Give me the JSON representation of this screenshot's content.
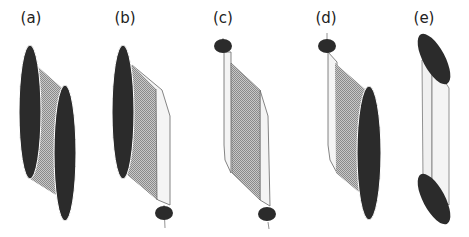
{
  "figure": {
    "panels": [
      {
        "id": "a",
        "label": "(a)",
        "description": "large ellipse left-top, large ellipse right-bottom, hatched band between"
      },
      {
        "id": "b",
        "label": "(b)",
        "description": "large ellipse left-top, small ellipse bottom-right, hatched band and thin light strip"
      },
      {
        "id": "c",
        "label": "(c)",
        "description": "small ellipse top-left, small ellipse bottom-right, hatched parallelogram with light side strips"
      },
      {
        "id": "d",
        "label": "(d)",
        "description": "small ellipse top-left, large ellipse bottom-right, hatched band and light strip"
      },
      {
        "id": "e",
        "label": "(e)",
        "description": "tilted ellipse top, tilted ellipse bottom, light strips connecting"
      }
    ],
    "colors": {
      "ellipse_fill": "#2b2b2b",
      "hatch_fill": "#a8a8a8",
      "strip_fill": "#f2f2f2",
      "stroke": "#555555"
    }
  }
}
